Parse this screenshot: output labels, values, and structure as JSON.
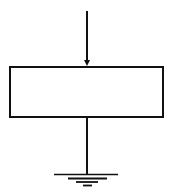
{
  "diagram": {
    "type": "block-with-input-and-ground",
    "elements": [
      {
        "name": "input-arrow",
        "from": [
          87,
          11
        ],
        "to": [
          87,
          66
        ]
      },
      {
        "name": "block",
        "x": 10,
        "y": 67,
        "width": 153,
        "height": 50,
        "label": ""
      },
      {
        "name": "output-wire",
        "from": [
          87,
          117
        ],
        "to": [
          87,
          174
        ]
      },
      {
        "name": "ground-symbol",
        "lines": 4
      }
    ],
    "colors": {
      "stroke": "#111111",
      "background": "#ffffff"
    }
  }
}
